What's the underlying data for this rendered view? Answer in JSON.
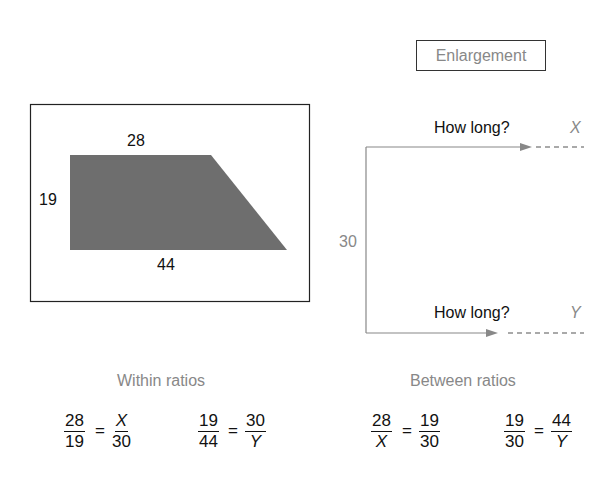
{
  "shape": {
    "top_label": "28",
    "side_label": "19",
    "bottom_label": "44",
    "fill_color": "#6e6e6e"
  },
  "enlargement": {
    "title": "Enlargement",
    "side_label": "30",
    "top_question": "How long?",
    "top_variable": "X",
    "bottom_question": "How long?",
    "bottom_variable": "Y"
  },
  "within_ratios": {
    "heading": "Within ratios",
    "eq1": {
      "lhs_num": "28",
      "lhs_den": "19",
      "eq": "=",
      "rhs_num": "X",
      "rhs_den": "30"
    },
    "eq2": {
      "lhs_num": "19",
      "lhs_den": "44",
      "eq": "=",
      "rhs_num": "30",
      "rhs_den": "Y"
    }
  },
  "between_ratios": {
    "heading": "Between ratios",
    "eq1": {
      "lhs_num": "28",
      "lhs_den": "X",
      "eq": "=",
      "rhs_num": "19",
      "rhs_den": "30"
    },
    "eq2": {
      "lhs_num": "19",
      "lhs_den": "30",
      "eq": "=",
      "rhs_num": "44",
      "rhs_den": "Y"
    }
  }
}
